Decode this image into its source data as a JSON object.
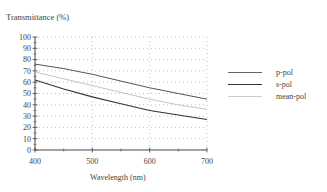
{
  "chart_data": {
    "type": "line",
    "title": "",
    "ylabel": "Transmittance (%)",
    "xlabel": "Wavelength (nm)",
    "xlim": [
      400,
      700
    ],
    "ylim": [
      0,
      100
    ],
    "xticks": [
      400,
      500,
      600,
      700
    ],
    "yticks": [
      0,
      10,
      20,
      30,
      40,
      50,
      60,
      70,
      80,
      90,
      100
    ],
    "grid": true,
    "legend_position": "right",
    "x": [
      400,
      450,
      500,
      550,
      600,
      650,
      700
    ],
    "series": [
      {
        "name": "p-pol",
        "color": "#555555",
        "values": [
          76,
          72,
          67,
          61,
          55,
          50,
          45
        ]
      },
      {
        "name": "s-pol",
        "color": "#444444",
        "values": [
          62,
          54,
          47,
          41,
          35,
          31,
          27
        ]
      },
      {
        "name": "mean-pol",
        "color": "#bbbbbb",
        "values": [
          69,
          63,
          57,
          51,
          45,
          40,
          36
        ]
      }
    ]
  },
  "labels": {
    "ylabel": "Transmittance (%)",
    "xlabel": "Wavelength (nm)",
    "legend": [
      "p-pol",
      "s-pol",
      "mean-pol"
    ]
  }
}
